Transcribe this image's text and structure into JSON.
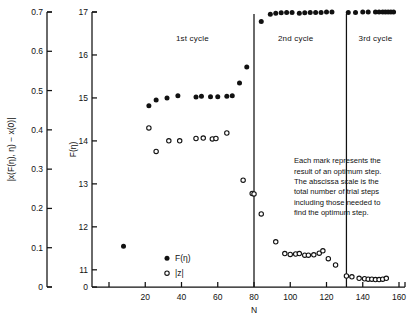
{
  "chart_data": {
    "type": "scatter",
    "title": "",
    "xlabel": "N",
    "ylabel_left": "|x(F(η), η) − x(0)|",
    "ylabel_right": "F(η)",
    "xlim": [
      0,
      160
    ],
    "xticks": [
      0,
      20,
      40,
      60,
      80,
      100,
      120,
      140,
      160
    ],
    "xticklabels": [
      "0",
      "20",
      "40",
      "60",
      "80",
      "100",
      "120",
      "140",
      "160"
    ],
    "left_axis": {
      "lim": [
        0,
        0.7
      ],
      "ticks": [
        0,
        0.1,
        0.2,
        0.3,
        0.4,
        0.5,
        0.6,
        0.7
      ],
      "ticklabels": [
        "0",
        "0.1",
        "0.2",
        "0.3",
        "0.4",
        "0.5",
        "0.6",
        "0.7"
      ]
    },
    "right_axis": {
      "lim": [
        10.6,
        17
      ],
      "ticks": [
        11,
        12,
        13,
        14,
        15,
        16,
        17
      ],
      "ticklabels": [
        "11",
        "12",
        "13",
        "14",
        "15",
        "16",
        "17"
      ],
      "zero_label": "0",
      "broken": true
    },
    "grid": false,
    "legend_position": "inside-lower-left",
    "series": [
      {
        "name": "F(η)",
        "marker": "filled-circle",
        "axis": "right",
        "points": [
          [
            8,
            11.55
          ],
          [
            22,
            14.82
          ],
          [
            26,
            14.95
          ],
          [
            32,
            15.0
          ],
          [
            38,
            15.05
          ],
          [
            48,
            15.02
          ],
          [
            51,
            15.04
          ],
          [
            56,
            15.03
          ],
          [
            60,
            15.03
          ],
          [
            65,
            15.04
          ],
          [
            68,
            15.05
          ],
          [
            72,
            15.35
          ],
          [
            76,
            15.72
          ],
          [
            84,
            16.78
          ],
          [
            89,
            16.95
          ],
          [
            92,
            16.97
          ],
          [
            95,
            16.98
          ],
          [
            98,
            16.99
          ],
          [
            101,
            16.99
          ],
          [
            105,
            16.97
          ],
          [
            108,
            16.98
          ],
          [
            111,
            16.99
          ],
          [
            114,
            16.99
          ],
          [
            117,
            16.99
          ],
          [
            120,
            17.0
          ],
          [
            123,
            17.0
          ],
          [
            132,
            16.99
          ],
          [
            136,
            16.99
          ],
          [
            140,
            17.0
          ],
          [
            143,
            17.0
          ],
          [
            147,
            17.0
          ],
          [
            149,
            17.0
          ],
          [
            151,
            17.0
          ],
          [
            152.5,
            17.0
          ],
          [
            154,
            17.0
          ],
          [
            155.5,
            17.0
          ],
          [
            157,
            17.0
          ]
        ]
      },
      {
        "name": "|z|",
        "marker": "open-circle",
        "axis": "left",
        "points": [
          [
            22,
            0.405
          ],
          [
            26,
            0.345
          ],
          [
            33,
            0.372
          ],
          [
            39,
            0.372
          ],
          [
            48,
            0.378
          ],
          [
            52,
            0.379
          ],
          [
            57,
            0.377
          ],
          [
            59,
            0.378
          ],
          [
            65,
            0.392
          ],
          [
            74,
            0.272
          ],
          [
            79,
            0.238
          ],
          [
            80,
            0.237
          ],
          [
            84,
            0.186
          ],
          [
            92,
            0.115
          ],
          [
            97,
            0.085
          ],
          [
            100,
            0.083
          ],
          [
            103,
            0.084
          ],
          [
            105,
            0.085
          ],
          [
            108,
            0.081
          ],
          [
            110,
            0.081
          ],
          [
            113,
            0.082
          ],
          [
            116,
            0.086
          ],
          [
            118,
            0.092
          ],
          [
            121,
            0.072
          ],
          [
            125,
            0.056
          ],
          [
            131,
            0.028
          ],
          [
            134,
            0.026
          ],
          [
            138,
            0.022
          ],
          [
            141,
            0.021
          ],
          [
            143,
            0.02
          ],
          [
            145,
            0.02
          ],
          [
            147,
            0.019
          ],
          [
            149,
            0.019
          ],
          [
            151,
            0.02
          ],
          [
            153,
            0.022
          ]
        ]
      }
    ],
    "cycle_dividers": [
      80,
      131
    ],
    "cycle_labels": [
      {
        "text": "1st cycle",
        "x": 46
      },
      {
        "text": "2nd cycle",
        "x": 103
      },
      {
        "text": "3rd cycle",
        "x": 147
      }
    ],
    "legend": [
      {
        "marker": "filled-circle",
        "label": "F(η)"
      },
      {
        "marker": "open-circle",
        "label": "|z|"
      }
    ],
    "annotation": [
      "Each mark represents the",
      "result of an optimum step.",
      "The abscissa scale is the",
      "total number of trial steps",
      "including those needed to",
      "find the optimum step."
    ]
  }
}
